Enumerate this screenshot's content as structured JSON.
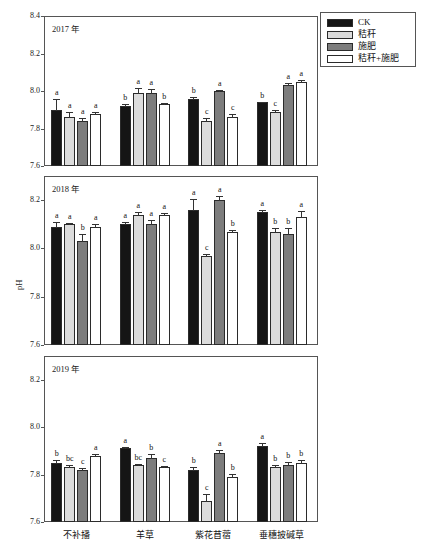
{
  "chart_data": {
    "type": "bar",
    "title": "0～10cm",
    "xlabel": "",
    "ylabel": "pH",
    "grid": false,
    "legend_position": "top-right",
    "categories": [
      "不补播",
      "羊草",
      "紫花苜蓿",
      "垂穗披碱草"
    ],
    "legend": [
      "CK",
      "秸秆",
      "施肥",
      "秸秆+施肥"
    ],
    "panels": [
      {
        "name": "2017 年",
        "ylim": [
          7.6,
          8.4
        ],
        "yticks": [
          "8.4",
          "8.2",
          "8.0",
          "7.8",
          "7.6"
        ],
        "ytickvals": [
          8.4,
          8.2,
          8.0,
          7.8,
          7.6
        ],
        "series": [
          {
            "name": "CK",
            "values": [
              7.9,
              7.92,
              7.96,
              7.94
            ],
            "errors": [
              0.055,
              0.012,
              0.008,
              0.004
            ],
            "letters": [
              "a",
              "b",
              "b",
              "b"
            ]
          },
          {
            "name": "秸秆",
            "values": [
              7.86,
              7.99,
              7.84,
              7.89
            ],
            "errors": [
              0.03,
              0.025,
              0.018,
              0.008
            ],
            "letters": [
              "a",
              "a",
              "c",
              "c"
            ]
          },
          {
            "name": "施肥",
            "values": [
              7.84,
              7.99,
              8.0,
              8.03
            ],
            "errors": [
              0.016,
              0.02,
              0.006,
              0.012
            ],
            "letters": [
              "a",
              "a",
              "a",
              "a"
            ]
          },
          {
            "name": "秸秆+施肥",
            "values": [
              7.88,
              7.93,
              7.86,
              8.05
            ],
            "errors": [
              0.006,
              0.004,
              0.016,
              0.01
            ],
            "letters": [
              "a",
              "b",
              "c",
              "a"
            ]
          }
        ]
      },
      {
        "name": "2018 年",
        "ylim": [
          7.6,
          8.3
        ],
        "yticks": [
          "8.2",
          "8.0",
          "7.8",
          "7.6"
        ],
        "ytickvals": [
          8.2,
          8.0,
          7.8,
          7.6
        ],
        "series": [
          {
            "name": "CK",
            "values": [
              8.09,
              8.1,
              8.16,
              8.15
            ],
            "errors": [
              0.02,
              0.008,
              0.045,
              0.01
            ],
            "letters": [
              "a",
              "a",
              "a",
              "a"
            ]
          },
          {
            "name": "秸秆",
            "values": [
              8.1,
              8.14,
              7.97,
              8.07
            ],
            "errors": [
              0.006,
              0.012,
              0.006,
              0.014
            ],
            "letters": [
              "a",
              "a",
              "c",
              "b"
            ]
          },
          {
            "name": "施肥",
            "values": [
              8.03,
              8.1,
              8.2,
              8.06
            ],
            "errors": [
              0.028,
              0.016,
              0.018,
              0.026
            ],
            "letters": [
              "b",
              "a",
              "a",
              "b"
            ]
          },
          {
            "name": "秸秆+施肥",
            "values": [
              8.09,
              8.14,
              8.07,
              8.13
            ],
            "errors": [
              0.01,
              0.006,
              0.008,
              0.026
            ],
            "letters": [
              "a",
              "a",
              "b",
              "a"
            ]
          }
        ]
      },
      {
        "name": "2019 年",
        "ylim": [
          7.6,
          8.3
        ],
        "yticks": [
          "8.2",
          "8.0",
          "7.8",
          "7.6"
        ],
        "ytickvals": [
          8.2,
          8.0,
          7.8,
          7.6
        ],
        "series": [
          {
            "name": "CK",
            "values": [
              7.85,
              7.91,
              7.82,
              7.92
            ],
            "errors": [
              0.012,
              0.008,
              0.014,
              0.012
            ],
            "letters": [
              "b",
              "a",
              "b",
              "a"
            ]
          },
          {
            "name": "秸秆",
            "values": [
              7.83,
              7.84,
              7.69,
              7.83
            ],
            "errors": [
              0.01,
              0.006,
              0.026,
              0.012
            ],
            "letters": [
              "bc",
              "bc",
              "c",
              "b"
            ]
          },
          {
            "name": "施肥",
            "values": [
              7.82,
              7.87,
              7.89,
              7.84
            ],
            "errors": [
              0.006,
              0.016,
              0.012,
              0.014
            ],
            "letters": [
              "c",
              "b",
              "a",
              "b"
            ]
          },
          {
            "name": "秸秆+施肥",
            "values": [
              7.88,
              7.83,
              7.79,
              7.85
            ],
            "errors": [
              0.006,
              0.008,
              0.014,
              0.01
            ],
            "letters": [
              "a",
              "c",
              "b",
              "b"
            ]
          }
        ]
      }
    ]
  }
}
